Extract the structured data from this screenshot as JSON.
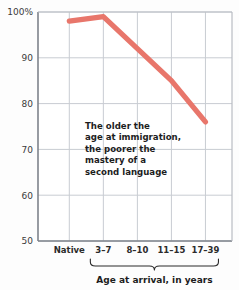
{
  "chart_data": {
    "type": "line",
    "title": "",
    "subtitle": "",
    "xlabel": "Age at arrival, in years",
    "ylabel": "",
    "categories": [
      "Native",
      "3–7",
      "8–10",
      "11–15",
      "17–39"
    ],
    "series": [
      {
        "name": "Mastery of second language",
        "values": [
          98,
          99,
          92,
          85,
          76
        ],
        "color": "#e8766b"
      }
    ],
    "ylim": [
      50,
      100
    ],
    "yticks": [
      50,
      60,
      70,
      80,
      90,
      100
    ],
    "ytick_labels": [
      "50",
      "60",
      "70",
      "80",
      "90",
      "100%"
    ],
    "grid": true,
    "legend": "none",
    "annotations": [
      {
        "name": "trend-note",
        "lines": [
          "The older the",
          "age at immigration,",
          "the poorer the",
          "mastery of a",
          "second language"
        ]
      }
    ],
    "bracket": {
      "label": "Age at arrival, in years",
      "covers": [
        "3–7",
        "8–10",
        "11–15",
        "17–39"
      ]
    },
    "colors": {
      "line": "#e8766b",
      "grid": "#c8ccd2",
      "axis": "#8d9199",
      "text": "#1d1d1d",
      "background": "#fdfdfd"
    }
  }
}
